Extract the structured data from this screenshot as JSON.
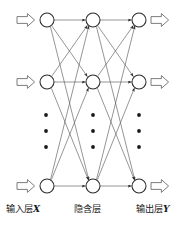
{
  "diagram": {
    "type": "neural-network",
    "title": "",
    "background_color": "#ffffff",
    "stroke_color": "#3a3a3a",
    "node_fill": "#ffffff",
    "dot_color": "#1a1a1a",
    "layers": [
      {
        "id": "input",
        "name": "input-layer",
        "caption_text": "输入层",
        "caption_symbol": "X",
        "x": 47,
        "node_count_visible": 3,
        "ellipsis_dots": 3,
        "has_incoming_block_arrows": true,
        "has_outgoing_block_arrows": false
      },
      {
        "id": "hidden",
        "name": "hidden-layer",
        "caption_text": "隐含层",
        "caption_symbol": "",
        "x": 93,
        "node_count_visible": 3,
        "ellipsis_dots": 3,
        "has_incoming_block_arrows": false,
        "has_outgoing_block_arrows": false
      },
      {
        "id": "output",
        "name": "output-layer",
        "caption_text": "输出层",
        "caption_symbol": "Y",
        "x": 139,
        "node_count_visible": 3,
        "ellipsis_dots": 3,
        "has_incoming_block_arrows": false,
        "has_outgoing_block_arrows": true
      }
    ],
    "node_rows_y": [
      20,
      82,
      186
    ],
    "node_radius": 7,
    "ellipsis_y": [
      115,
      131,
      147
    ],
    "connections": "fully-connected-with-arrowheads",
    "block_arrow_in_x": 17,
    "block_arrow_out_x": 151
  }
}
